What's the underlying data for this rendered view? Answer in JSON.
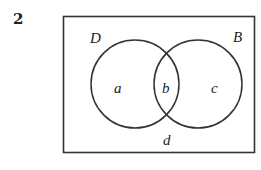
{
  "question_number": "2",
  "venn": {
    "universal_region_label": "d",
    "sets": [
      {
        "name": "D",
        "region_label": "a"
      },
      {
        "name": "B",
        "region_label": "c"
      }
    ],
    "intersection_label": "b"
  }
}
